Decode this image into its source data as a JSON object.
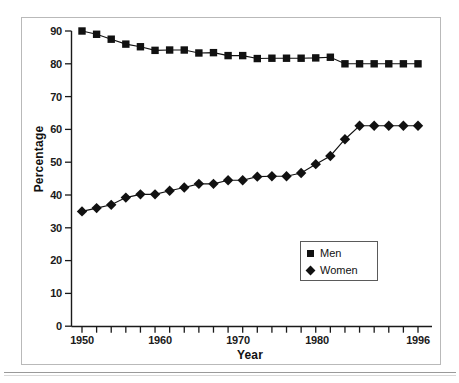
{
  "figure": {
    "background_color": "#ffffff",
    "frame_color": "#b9b9b9",
    "ink_color": "#111111"
  },
  "axes": {
    "y_title": "Percentage",
    "x_title": "Year",
    "y_ticks": [
      "0",
      "10",
      "20",
      "30",
      "40",
      "50",
      "60",
      "70",
      "80",
      "90"
    ],
    "x_labeled_ticks": [
      "1950",
      "1960",
      "1970",
      "1980",
      "1996"
    ]
  },
  "legend": {
    "items": [
      {
        "label": "Men",
        "marker": "square-marker",
        "color": "#111111"
      },
      {
        "label": "Women",
        "marker": "diamond-marker",
        "color": "#111111"
      }
    ]
  },
  "chart_data": {
    "type": "line",
    "title": "",
    "subtitle": "",
    "xlabel": "Year",
    "ylabel": "Percentage",
    "xlim": [
      1950,
      1996
    ],
    "ylim": [
      0,
      90
    ],
    "ytick_interval": 10,
    "xtick_interval": 2,
    "grid": false,
    "legend_position": "lower-right-inside",
    "x": [
      1950,
      1952,
      1954,
      1956,
      1958,
      1960,
      1962,
      1964,
      1966,
      1968,
      1970,
      1972,
      1974,
      1976,
      1978,
      1980,
      1982,
      1984,
      1986,
      1988,
      1990,
      1992,
      1994,
      1996
    ],
    "series": [
      {
        "name": "Men",
        "marker": "square",
        "color": "#111111",
        "values": [
          90.0,
          89.0,
          87.5,
          86.0,
          85.2,
          84.1,
          84.2,
          84.2,
          83.3,
          83.4,
          82.5,
          82.5,
          81.6,
          81.7,
          81.7,
          81.7,
          81.8,
          82.0,
          80.0,
          80.0,
          80.0,
          80.0,
          80.0,
          80.0
        ]
      },
      {
        "name": "Women",
        "marker": "diamond",
        "color": "#111111",
        "values": [
          35.0,
          36.0,
          37.0,
          39.2,
          40.2,
          40.2,
          41.3,
          42.3,
          43.4,
          43.4,
          44.5,
          44.5,
          45.6,
          45.7,
          45.7,
          46.7,
          49.4,
          51.9,
          57.0,
          61.1,
          61.1,
          61.1,
          61.1,
          61.1
        ]
      }
    ]
  }
}
